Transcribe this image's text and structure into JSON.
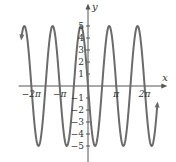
{
  "chart_data": {
    "type": "line",
    "title": "",
    "function": "y = -5 sin(2x)",
    "amplitude": 5,
    "frequency": 2,
    "phase_sign": -1,
    "xlabel": "x",
    "ylabel": "y",
    "xlim_pi": [
      -2.45,
      2.45
    ],
    "x_domain_pi": [
      -2.35,
      2.45
    ],
    "ylim": [
      -6.2,
      6.2
    ],
    "x_ticks": [
      {
        "value_pi": -2,
        "label": "−2π"
      },
      {
        "value_pi": -1,
        "label": "−π"
      },
      {
        "value_pi": 1,
        "label": "π"
      },
      {
        "value_pi": 2,
        "label": "2π"
      }
    ],
    "y_ticks": [
      {
        "value": 5,
        "label": "5"
      },
      {
        "value": 4,
        "label": "4"
      },
      {
        "value": 3,
        "label": "3"
      },
      {
        "value": 2,
        "label": "2"
      },
      {
        "value": 1,
        "label": "1"
      },
      {
        "value": -1,
        "label": "−1"
      },
      {
        "value": -2,
        "label": "−2"
      },
      {
        "value": -3,
        "label": "−3"
      },
      {
        "value": -4,
        "label": "−4"
      },
      {
        "value": -5,
        "label": "−5"
      }
    ],
    "grid": false,
    "legend": "none",
    "colors": {
      "curve": "#6b6b6b",
      "axis": "#555555"
    }
  }
}
